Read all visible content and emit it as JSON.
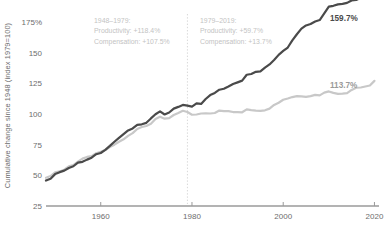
{
  "chart_data": {
    "type": "line",
    "title": "",
    "xlabel": "",
    "ylabel": "Cumulative change since 1948 (index 1979=100)",
    "xlim": [
      1948,
      2021
    ],
    "ylim": [
      25,
      175
    ],
    "grid": false,
    "legend": "none (series labeled at line ends)",
    "y_ticks": [
      "175%",
      "150",
      "125",
      "100",
      "75",
      "50",
      "25"
    ],
    "y_tick_values": [
      175,
      150,
      125,
      100,
      75,
      50,
      25
    ],
    "x_ticks": [
      "1960",
      "1980",
      "2000",
      "2020"
    ],
    "x_tick_values": [
      1960,
      1980,
      2000,
      2020
    ],
    "divider_year": 1979,
    "colors": {
      "productivity": "#4a4a4a",
      "compensation": "#c8c8c8",
      "axis": "#9a9a9a",
      "annotation": "#c3c3c3",
      "tick_text": "#6d6d6d"
    },
    "x": [
      1948,
      1949,
      1950,
      1951,
      1952,
      1953,
      1954,
      1955,
      1956,
      1957,
      1958,
      1959,
      1960,
      1961,
      1962,
      1963,
      1964,
      1965,
      1966,
      1967,
      1968,
      1969,
      1970,
      1971,
      1972,
      1973,
      1974,
      1975,
      1976,
      1977,
      1978,
      1979,
      1980,
      1981,
      1982,
      1983,
      1984,
      1985,
      1986,
      1987,
      1988,
      1989,
      1990,
      1991,
      1992,
      1993,
      1994,
      1995,
      1996,
      1997,
      1998,
      1999,
      2000,
      2001,
      2002,
      2003,
      2004,
      2005,
      2006,
      2007,
      2008,
      2009,
      2010,
      2011,
      2012,
      2013,
      2014,
      2015,
      2016,
      2017,
      2018,
      2019,
      2020
    ],
    "series": [
      {
        "name": "Productivity",
        "color": "#4a4a4a",
        "end_label": "159.7%",
        "end_value": 159.7,
        "values": [
          45.8,
          47.2,
          51.0,
          52.6,
          53.8,
          56.0,
          57.4,
          60.4,
          61.0,
          62.8,
          64.4,
          67.2,
          68.2,
          70.8,
          74.0,
          77.4,
          80.6,
          83.6,
          86.6,
          88.2,
          91.2,
          91.6,
          92.8,
          96.4,
          99.8,
          102.2,
          99.6,
          101.2,
          104.4,
          105.8,
          107.4,
          106.8,
          106.0,
          108.6,
          108.2,
          112.2,
          115.4,
          117.2,
          119.8,
          120.6,
          122.4,
          124.4,
          125.8,
          127.2,
          132.0,
          132.6,
          134.4,
          134.8,
          137.8,
          140.4,
          144.0,
          148.2,
          151.4,
          154.2,
          160.0,
          165.0,
          169.6,
          172.2,
          173.4,
          175.4,
          176.6,
          182.0,
          187.6,
          188.2,
          189.4,
          189.8,
          190.6,
          192.6,
          193.0,
          194.6,
          197.2,
          199.4,
          207.0
        ]
      },
      {
        "name": "Compensation",
        "color": "#c8c8c8",
        "end_label": "113.7%",
        "end_value": 113.7,
        "values": [
          48.0,
          49.4,
          52.4,
          53.2,
          54.6,
          57.4,
          58.4,
          61.2,
          63.6,
          65.0,
          65.6,
          68.0,
          69.2,
          70.6,
          73.0,
          75.0,
          77.4,
          79.4,
          82.2,
          84.4,
          87.8,
          89.4,
          90.2,
          92.0,
          96.0,
          97.8,
          96.2,
          96.6,
          99.2,
          100.8,
          102.6,
          101.6,
          99.4,
          99.6,
          100.4,
          100.6,
          100.4,
          100.8,
          102.8,
          102.4,
          102.4,
          101.6,
          101.6,
          101.4,
          103.8,
          103.2,
          102.8,
          102.6,
          103.0,
          104.4,
          107.4,
          109.2,
          111.6,
          112.6,
          113.8,
          114.6,
          114.4,
          114.0,
          114.6,
          115.6,
          115.2,
          117.4,
          118.4,
          117.2,
          116.4,
          116.6,
          117.0,
          119.6,
          121.4,
          121.6,
          122.4,
          123.2,
          127.0
        ]
      }
    ],
    "annotations": [
      {
        "id": "period-1948-1979",
        "lines": [
          "1948–1979:",
          "Productivity: +118.4%",
          "Compensation: +107.5%"
        ],
        "period": "1948–1979",
        "productivity_change": "+118.4%",
        "compensation_change": "+107.5%"
      },
      {
        "id": "period-1979-2019",
        "lines": [
          "1979–2019:",
          "Productivity: +59.7%",
          "Compensation: +13.7%"
        ],
        "period": "1979–2019",
        "productivity_change": "+59.7%",
        "compensation_change": "+13.7%"
      }
    ]
  }
}
